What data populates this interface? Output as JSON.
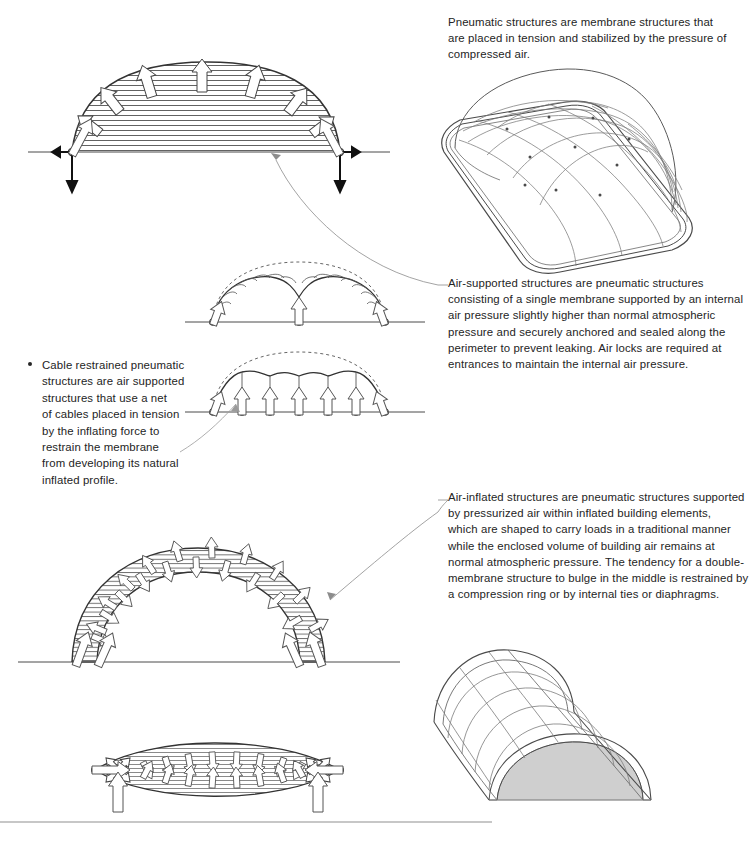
{
  "document": {
    "title": "Pneumatic Structures",
    "background_color": "#ffffff",
    "ink_color": "#2b2b2b",
    "shade_color": "#c9c9c9"
  },
  "notes": {
    "pneumatic": {
      "lines": [
        "Pneumatic structures are membrane structures that",
        "are placed in tension and stabilized by the pressure of",
        "compressed air."
      ]
    },
    "air_supported": {
      "lines": [
        "Air-supported structures are pneumatic structures",
        "consisting of a single membrane supported by an internal",
        "air pressure slightly higher than normal atmospheric",
        "pressure and securely anchored and sealed along the",
        "perimeter to prevent leaking. Air locks are required at",
        "entrances to maintain the internal air pressure."
      ]
    },
    "air_inflated": {
      "lines": [
        "Air-inflated structures are pneumatic structures supported",
        "by pressurized air within inflated building elements,",
        "which are shaped to carry loads in a traditional manner",
        "while the enclosed volume of building air remains at",
        "normal atmospheric pressure. The tendency for a double-",
        "membrane structure to bulge in the middle is restrained by",
        "a compression ring or by internal ties or diaphragms."
      ]
    },
    "cable_restrained": {
      "bullet": "•",
      "lines": [
        "Cable restrained pneumatic",
        "structures are air supported",
        "structures that use a net",
        "of cables placed in tension",
        "by the inflating force to",
        "restrain the membrane",
        "from developing its natural",
        "inflated profile."
      ]
    }
  },
  "figures": {
    "air_supported_section": {
      "name": "air-supported dome section",
      "pressure_arrows": 7,
      "base_reactions": [
        "horizontal thrust",
        "vertical anchorage",
        "resultant"
      ]
    },
    "air_supported_3d": {
      "name": "air-supported dome perspective",
      "plan_shape": "rounded rectangle",
      "cable_net": true
    },
    "cable_restrained_single": {
      "name": "cable restrained dome with single central tie",
      "tie_downs": 1,
      "dashed_profile": "natural inflated profile"
    },
    "cable_restrained_multi": {
      "name": "cable restrained dome with cable net",
      "tie_downs": 5,
      "dashed_profile": "natural inflated profile"
    },
    "air_inflated_arch": {
      "name": "air-inflated double membrane arch section",
      "membranes": 2,
      "base_reactions": 4
    },
    "air_inflated_beam": {
      "name": "air-inflated lenticular beam",
      "end_anchors": 2,
      "supports": 2
    },
    "air_inflated_vault_3d": {
      "name": "air-inflated barrel vault perspective",
      "tube_rows": 5,
      "interior_shaded": true
    }
  },
  "footer": {
    "rule": true
  }
}
